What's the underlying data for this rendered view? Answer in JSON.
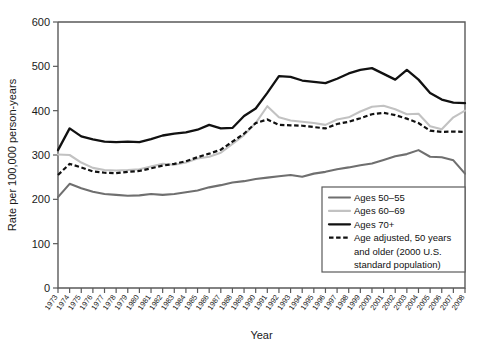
{
  "chart_data": {
    "type": "line",
    "title": "",
    "xlabel": "Year",
    "ylabel": "Rate per 100,000 person-years",
    "xlim": [
      1973,
      2008
    ],
    "ylim": [
      0,
      600
    ],
    "yticks": [
      0,
      100,
      200,
      300,
      400,
      500,
      600
    ],
    "grid": false,
    "legend_position": "bottom-right",
    "categories": [
      1973,
      1974,
      1975,
      1976,
      1977,
      1978,
      1979,
      1980,
      1981,
      1982,
      1983,
      1984,
      1985,
      1986,
      1987,
      1988,
      1989,
      1990,
      1991,
      1992,
      1993,
      1994,
      1995,
      1996,
      1997,
      1998,
      1999,
      2000,
      2001,
      2002,
      2003,
      2004,
      2005,
      2006,
      2007,
      2008
    ],
    "series": [
      {
        "name": "Ages 50–55",
        "color": "#6f6f6f",
        "style": "solid",
        "values": [
          205,
          235,
          225,
          217,
          212,
          210,
          208,
          209,
          212,
          210,
          212,
          216,
          220,
          227,
          232,
          238,
          241,
          246,
          249,
          252,
          255,
          251,
          258,
          262,
          268,
          272,
          277,
          281,
          289,
          297,
          302,
          311,
          296,
          295,
          288,
          258
        ]
      },
      {
        "name": "Ages 60–69",
        "color": "#c2c2c2",
        "style": "solid",
        "values": [
          301,
          300,
          283,
          271,
          266,
          265,
          266,
          268,
          274,
          280,
          278,
          283,
          292,
          296,
          305,
          325,
          345,
          372,
          410,
          385,
          378,
          375,
          372,
          368,
          380,
          385,
          398,
          409,
          411,
          403,
          392,
          393,
          365,
          358,
          385,
          400
        ]
      },
      {
        "name": "Ages 70+",
        "color": "#111111",
        "style": "solid",
        "values": [
          311,
          360,
          342,
          335,
          330,
          329,
          330,
          329,
          336,
          344,
          348,
          351,
          357,
          368,
          360,
          361,
          388,
          405,
          440,
          478,
          476,
          468,
          465,
          462,
          472,
          484,
          492,
          496,
          483,
          470,
          492,
          470,
          440,
          425,
          418,
          417
        ]
      },
      {
        "name": "Age adjusted, 50 years and older (2000 U.S. standard population)",
        "color": "#111111",
        "style": "dashed",
        "values": [
          255,
          280,
          272,
          263,
          260,
          259,
          262,
          264,
          270,
          276,
          280,
          286,
          295,
          303,
          312,
          330,
          348,
          372,
          380,
          368,
          367,
          366,
          363,
          360,
          370,
          375,
          383,
          392,
          395,
          390,
          382,
          372,
          355,
          352,
          353,
          352
        ]
      }
    ]
  },
  "legend": {
    "entries": [
      {
        "label": "Ages 50–55",
        "swatch": "solid-gray-medium"
      },
      {
        "label": "Ages 60–69",
        "swatch": "solid-gray-light"
      },
      {
        "label": "Ages 70+",
        "swatch": "solid-black-thick"
      },
      {
        "label": "Age adjusted, 50 years",
        "swatch": "dashed-black"
      },
      {
        "label": "and older (2000 U.S.",
        "swatch": "none"
      },
      {
        "label": "standard population)",
        "swatch": "none"
      }
    ]
  }
}
